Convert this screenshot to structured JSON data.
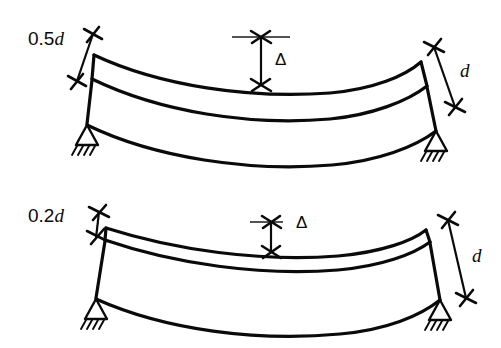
{
  "figure": {
    "background_color": "#ffffff",
    "line_color": "#0a0a0a",
    "width": 501,
    "height": 348
  },
  "diagrams": [
    {
      "id": "upper",
      "depth_label": "0.5d",
      "depth_label_plain": "0.5",
      "depth_label_italic": "d",
      "deflection_label": "Δ",
      "depth_dimension_label": "d",
      "support_left": "pin-support",
      "support_right": "pin-support",
      "description": "Deep beam, depth 0.5d, small deflection"
    },
    {
      "id": "lower",
      "depth_label": "0.2d",
      "depth_label_plain": "0.2",
      "depth_label_italic": "d",
      "deflection_label": "Δ",
      "depth_dimension_label": "d",
      "support_left": "pin-support",
      "support_right": "pin-support",
      "description": "Shallow beam, depth 0.2d, larger deflection"
    }
  ],
  "labels": {
    "upper_depth": "0.5",
    "upper_depth_italic": "d",
    "upper_delta": "Δ",
    "upper_d": "d",
    "lower_depth": "0.2",
    "lower_depth_italic": "d",
    "lower_delta": "Δ",
    "lower_d": "d"
  }
}
